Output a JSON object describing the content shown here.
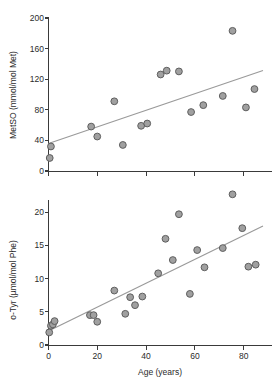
{
  "figure": {
    "title": "",
    "panels": [
      "metso-vs-age",
      "otyr-vs-age"
    ]
  },
  "chart_data": [
    {
      "id": "panel-top",
      "type": "scatter",
      "title": "",
      "xlabel": "",
      "ylabel": "MetSO (mmol/mol Met)",
      "xlim": [
        0,
        88
      ],
      "ylim": [
        0,
        205
      ],
      "xticks": [
        0,
        20,
        40,
        60,
        80
      ],
      "xtick_labels": [
        "",
        "",
        "",
        "",
        ""
      ],
      "yticks": [
        0,
        40,
        80,
        120,
        160,
        200
      ],
      "ytick_labels": [
        "0",
        "40",
        "80",
        "120",
        "160",
        "200"
      ],
      "grid": false,
      "legend": "none",
      "marker_fill": "#a0a0a0",
      "marker_edge": "#5e5e5e",
      "trendline_color": "#9a9a9a",
      "points": [
        {
          "x": 0.5,
          "y": 17
        },
        {
          "x": 1.0,
          "y": 32
        },
        {
          "x": 17.5,
          "y": 58
        },
        {
          "x": 20.0,
          "y": 45
        },
        {
          "x": 27.0,
          "y": 91
        },
        {
          "x": 30.5,
          "y": 34
        },
        {
          "x": 38.0,
          "y": 59
        },
        {
          "x": 40.5,
          "y": 62
        },
        {
          "x": 46.0,
          "y": 126
        },
        {
          "x": 48.5,
          "y": 131
        },
        {
          "x": 53.5,
          "y": 130
        },
        {
          "x": 58.5,
          "y": 77
        },
        {
          "x": 63.5,
          "y": 86
        },
        {
          "x": 71.5,
          "y": 98
        },
        {
          "x": 75.5,
          "y": 183
        },
        {
          "x": 81.0,
          "y": 83
        },
        {
          "x": 84.5,
          "y": 107
        }
      ],
      "trendline": {
        "x0": 0,
        "y0": 36,
        "x1": 88,
        "y1": 131
      }
    },
    {
      "id": "panel-bottom",
      "type": "scatter",
      "title": "",
      "xlabel": "Age (years)",
      "ylabel": "o-Tyr (µmol/mol Phe)",
      "xlim": [
        0,
        88
      ],
      "ylim": [
        0,
        23.5
      ],
      "xticks": [
        0,
        20,
        40,
        60,
        80
      ],
      "xtick_labels": [
        "0",
        "20",
        "40",
        "60",
        "80"
      ],
      "yticks": [
        0,
        5,
        10,
        15,
        20
      ],
      "ytick_labels": [
        "0",
        "5",
        "10",
        "15",
        "20"
      ],
      "grid": false,
      "legend": "none",
      "marker_fill": "#a0a0a0",
      "marker_edge": "#5e5e5e",
      "trendline_color": "#9a9a9a",
      "points": [
        {
          "x": 0.3,
          "y": 1.9
        },
        {
          "x": 1.0,
          "y": 2.9
        },
        {
          "x": 1.8,
          "y": 3.1
        },
        {
          "x": 2.5,
          "y": 3.6
        },
        {
          "x": 17.0,
          "y": 4.5
        },
        {
          "x": 18.5,
          "y": 4.5
        },
        {
          "x": 20.0,
          "y": 3.5
        },
        {
          "x": 27.0,
          "y": 8.2
        },
        {
          "x": 31.5,
          "y": 4.7
        },
        {
          "x": 33.5,
          "y": 7.2
        },
        {
          "x": 35.5,
          "y": 6.0
        },
        {
          "x": 38.5,
          "y": 7.3
        },
        {
          "x": 45.0,
          "y": 10.8
        },
        {
          "x": 48.0,
          "y": 16.0
        },
        {
          "x": 51.0,
          "y": 12.8
        },
        {
          "x": 53.5,
          "y": 19.7
        },
        {
          "x": 58.0,
          "y": 7.7
        },
        {
          "x": 61.0,
          "y": 14.3
        },
        {
          "x": 64.0,
          "y": 11.7
        },
        {
          "x": 71.5,
          "y": 14.6
        },
        {
          "x": 75.5,
          "y": 22.7
        },
        {
          "x": 79.5,
          "y": 17.6
        },
        {
          "x": 82.0,
          "y": 11.8
        },
        {
          "x": 85.0,
          "y": 12.1
        }
      ],
      "trendline": {
        "x0": 0,
        "y0": 2.1,
        "x1": 88,
        "y1": 17.9
      }
    }
  ]
}
